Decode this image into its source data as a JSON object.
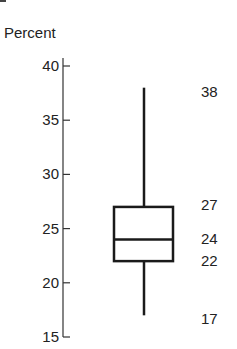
{
  "chart_data": {
    "type": "boxplot",
    "title": "",
    "xlabel": "",
    "ylabel": "Percent",
    "ylim": [
      15,
      40
    ],
    "yticks": [
      15,
      20,
      25,
      30,
      35,
      40
    ],
    "ytick_labels": [
      "15",
      "20",
      "25",
      "30",
      "35",
      "40"
    ],
    "grid": false,
    "legend": null,
    "series": [
      {
        "name": "",
        "min": 17,
        "q1": 22,
        "median": 24,
        "q3": 27,
        "max": 38
      }
    ],
    "annotations": [
      {
        "text": "38",
        "value": 38
      },
      {
        "text": "27",
        "value": 27
      },
      {
        "text": "24",
        "value": 24
      },
      {
        "text": "22",
        "value": 22
      },
      {
        "text": "17",
        "value": 17
      }
    ]
  },
  "colors": {
    "stroke": "#1a1a1a",
    "axis": "#333333",
    "text": "#222222",
    "background": "#ffffff"
  }
}
